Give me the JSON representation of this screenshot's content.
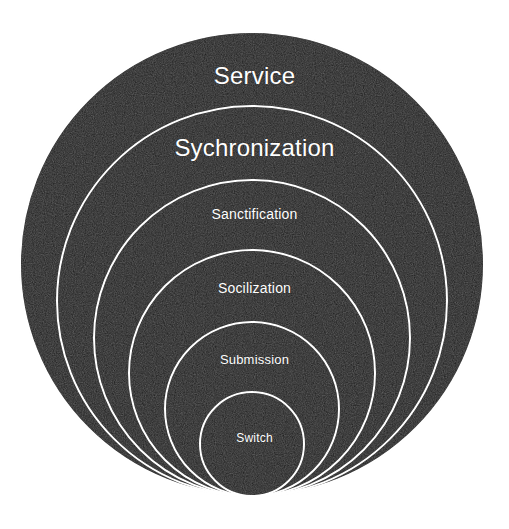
{
  "diagram": {
    "type": "concentric-bottom-tangent-circles",
    "background_color": "#ffffff",
    "fill_color": "#1c1c1c",
    "ring_stroke_color": "#ffffff",
    "label_color": "#ffffff",
    "ring_stroke_width": 2,
    "rings": [
      {
        "index": 1,
        "label": "Service",
        "center_x": 252,
        "center_y": 264,
        "radius": 232,
        "top_y": 32,
        "bottom_y": 496,
        "diameter": 463,
        "font_size": 24,
        "label_y": 62
      },
      {
        "index": 2,
        "label": "Sychronization",
        "center_x": 252,
        "center_y": 301,
        "radius": 195,
        "top_y": 106,
        "bottom_y": 496,
        "diameter": 390,
        "font_size": 24,
        "label_y": 134
      },
      {
        "index": 3,
        "label": "Sanctification",
        "center_x": 252,
        "center_y": 338,
        "radius": 158,
        "top_y": 180,
        "bottom_y": 496,
        "diameter": 315,
        "font_size": 14,
        "label_y": 206
      },
      {
        "index": 4,
        "label": "Socilization",
        "center_x": 252,
        "center_y": 373,
        "radius": 123,
        "top_y": 250,
        "bottom_y": 496,
        "diameter": 245,
        "font_size": 14,
        "label_y": 280
      },
      {
        "index": 5,
        "label": "Submission",
        "center_x": 252,
        "center_y": 409,
        "radius": 87,
        "top_y": 322,
        "bottom_y": 496,
        "diameter": 173,
        "font_size": 13,
        "label_y": 352
      },
      {
        "index": 6,
        "label": "Switch",
        "center_x": 252,
        "center_y": 444,
        "radius": 52,
        "top_y": 392,
        "bottom_y": 496,
        "diameter": 103,
        "font_size": 12,
        "label_y": 431
      }
    ]
  }
}
